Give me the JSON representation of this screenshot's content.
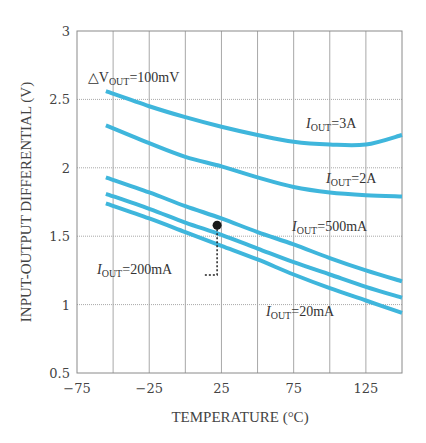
{
  "chart_data": {
    "type": "line",
    "title": "",
    "xlabel": "TEMPERATURE (°C)",
    "ylabel": "INPUT-OUTPUT DIFFERENTIAL (V)",
    "xlim": [
      -75,
      150
    ],
    "ylim": [
      0.5,
      3
    ],
    "x_ticks": [
      -75,
      -25,
      25,
      75,
      125
    ],
    "x_tick_labels": [
      "−75",
      "−25",
      "25",
      "75",
      "125"
    ],
    "x_gridlines": [
      -50,
      -25,
      0,
      25,
      50,
      75,
      100,
      125
    ],
    "y_ticks": [
      0.5,
      1,
      1.5,
      2,
      2.5,
      3
    ],
    "y_tick_labels": [
      "0.5",
      "1",
      "1.5",
      "2",
      "2.5",
      "3"
    ],
    "grid": true,
    "line_color": "#3fb6dc",
    "condition_label": {
      "prefix": "△V",
      "sub": "OUT",
      "suffix": "=100mV"
    },
    "x": [
      -55,
      -25,
      0,
      25,
      50,
      75,
      100,
      125,
      150
    ],
    "series": [
      {
        "name": "IOUT=3A",
        "label_main": "I",
        "label_sub": "OUT",
        "label_value": "=3A",
        "values": [
          2.56,
          2.45,
          2.37,
          2.3,
          2.24,
          2.19,
          2.17,
          2.17,
          2.24
        ]
      },
      {
        "name": "IOUT=2A",
        "label_main": "I",
        "label_sub": "OUT",
        "label_value": "=2A",
        "values": [
          2.31,
          2.18,
          2.08,
          2.01,
          1.93,
          1.86,
          1.82,
          1.8,
          1.79
        ]
      },
      {
        "name": "IOUT=500mA",
        "label_main": "I",
        "label_sub": "OUT",
        "label_value": "=500mA",
        "values": [
          1.93,
          1.82,
          1.72,
          1.63,
          1.53,
          1.44,
          1.34,
          1.25,
          1.17
        ]
      },
      {
        "name": "IOUT=200mA",
        "label_main": "I",
        "label_sub": "OUT",
        "label_value": "=200mA",
        "values": [
          1.81,
          1.7,
          1.6,
          1.51,
          1.41,
          1.31,
          1.22,
          1.13,
          1.05
        ]
      },
      {
        "name": "IOUT=20mA",
        "label_main": "I",
        "label_sub": "OUT",
        "label_value": "=20mA",
        "values": [
          1.74,
          1.63,
          1.53,
          1.43,
          1.33,
          1.22,
          1.12,
          1.03,
          0.94
        ]
      }
    ],
    "marker": {
      "x": 22,
      "y": 1.58,
      "series": "IOUT=200mA"
    }
  }
}
